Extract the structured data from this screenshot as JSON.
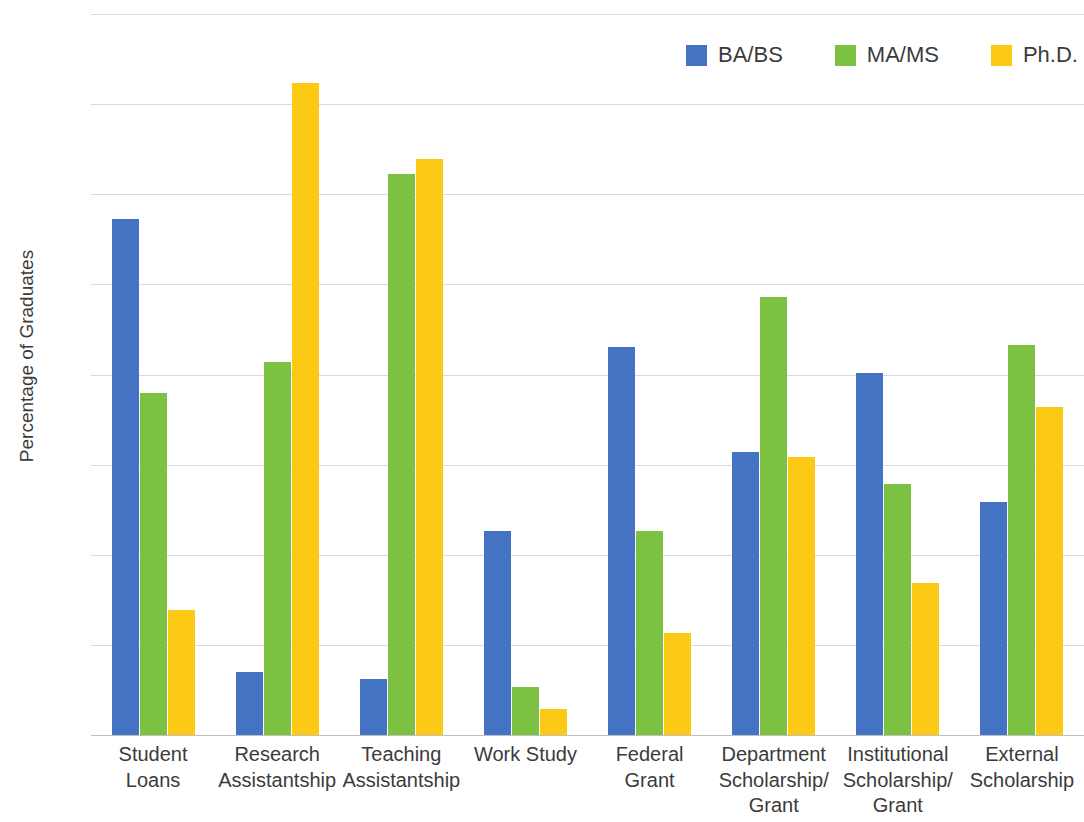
{
  "chart_data": {
    "type": "bar",
    "title": "",
    "xlabel": "",
    "ylabel": "Percentage of Graduates",
    "ylim": [
      0,
      80
    ],
    "ytick_values": [
      80,
      70,
      60,
      50,
      40,
      30,
      20,
      10,
      0
    ],
    "ytick_labels": [
      "80%",
      "70%",
      "60%",
      "50%",
      "40%",
      "30%",
      "20%",
      "10%",
      "0%"
    ],
    "grid": true,
    "legend_position": "top-right",
    "categories": [
      "Student Loans",
      "Research\nAssistantship",
      "Teaching\nAssistantship",
      "Work Study",
      "Federal\nGrant",
      "Department\nScholarship/\nGrant",
      "Institutional\nScholarship/\nGrant",
      "External\nScholarship"
    ],
    "series": [
      {
        "name": "BA/BS",
        "color": "#4573c4",
        "values": [
          57.3,
          7.0,
          6.2,
          22.6,
          43.1,
          31.4,
          40.2,
          25.8
        ]
      },
      {
        "name": "MA/MS",
        "color": "#7cc142",
        "values": [
          37.9,
          41.4,
          62.2,
          5.3,
          22.6,
          48.6,
          27.9,
          43.3
        ]
      },
      {
        "name": "Ph.D.",
        "color": "#fcc915",
        "values": [
          13.9,
          72.3,
          63.9,
          2.9,
          11.3,
          30.8,
          16.9,
          36.4
        ]
      }
    ]
  },
  "legend": {
    "items": [
      {
        "label": "BA/BS",
        "color": "#4573c4"
      },
      {
        "label": "MA/MS",
        "color": "#7cc142"
      },
      {
        "label": "Ph.D.",
        "color": "#fcc915"
      }
    ]
  }
}
